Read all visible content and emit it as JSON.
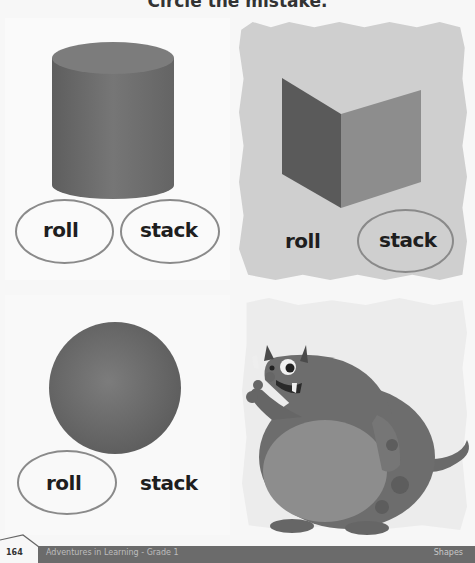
{
  "page": {
    "title": "Circle the mistake.",
    "footer": {
      "page_number": "164",
      "book_title": "Adventures in Learning - Grade 1",
      "section": "Shapes"
    }
  },
  "panels": [
    {
      "shape": "cylinder",
      "shape_icon": "cylinder-icon",
      "options": [
        {
          "label": "roll",
          "circled": true
        },
        {
          "label": "stack",
          "circled": true
        }
      ]
    },
    {
      "shape": "cube",
      "shape_icon": "cube-icon",
      "options": [
        {
          "label": "roll",
          "circled": false
        },
        {
          "label": "stack",
          "circled": true
        }
      ]
    },
    {
      "shape": "sphere",
      "shape_icon": "sphere-icon",
      "options": [
        {
          "label": "roll",
          "circled": true
        },
        {
          "label": "stack",
          "circled": false
        }
      ]
    },
    {
      "shape": "monster",
      "shape_icon": "monster-illustration",
      "options": []
    }
  ],
  "colors": {
    "shape_fill": "#6e6e6e",
    "oval_outline": "#8a8a8a",
    "text": "#1e1e1e",
    "footer_bar": "#6b6b6b"
  }
}
